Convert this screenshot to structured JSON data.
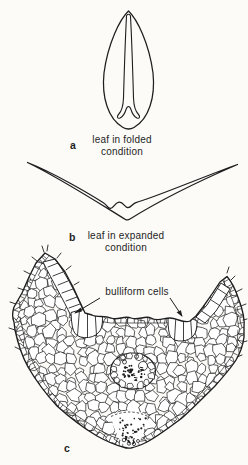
{
  "figure": {
    "panel_a": {
      "label": "a",
      "caption": [
        "leaf in folded",
        "condition"
      ]
    },
    "panel_b": {
      "label": "b",
      "caption": [
        "leaf in expanded",
        "condition"
      ]
    },
    "panel_c": {
      "label": "c",
      "annotation": "bulliform cells"
    }
  },
  "colors": {
    "ink": "#1e1e1e",
    "paper": "#fcfbf8"
  }
}
